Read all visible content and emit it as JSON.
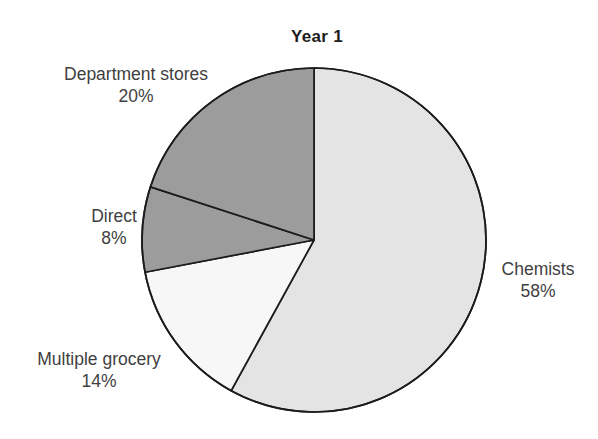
{
  "chart_data": {
    "type": "pie",
    "title": "Year 1",
    "subtitle": "",
    "xlabel": "",
    "ylabel": "",
    "legend_position": "none",
    "grid": false,
    "units": "percent",
    "categories": [
      "Chemists",
      "Multiple grocery",
      "Direct",
      "Department stores"
    ],
    "values": [
      58,
      14,
      8,
      20
    ],
    "labels": [
      "Chemists",
      "Multiple grocery",
      "Direct",
      "Department stores"
    ],
    "value_labels": [
      "58%",
      "14%",
      "8%",
      "20%"
    ],
    "start_angle_deg": 0,
    "direction": "clockwise",
    "slices": [
      {
        "name": "Chemists",
        "value": 58,
        "value_label": "58%",
        "color": "#e4e4e4",
        "start_deg": 0,
        "end_deg": 208.8,
        "label_position": "right"
      },
      {
        "name": "Multiple grocery",
        "value": 14,
        "value_label": "14%",
        "color": "#f7f7f7",
        "start_deg": 208.8,
        "end_deg": 259.2,
        "label_position": "bottom-left"
      },
      {
        "name": "Direct",
        "value": 8,
        "value_label": "8%",
        "color": "#9c9c9c",
        "start_deg": 259.2,
        "end_deg": 288.0,
        "label_position": "left"
      },
      {
        "name": "Department stores",
        "value": 20,
        "value_label": "20%",
        "color": "#9c9c9c",
        "start_deg": 288.0,
        "end_deg": 360.0,
        "label_position": "top-left"
      }
    ],
    "total": 100,
    "stroke_color": "#1c1c1c",
    "background": "#ffffff"
  },
  "labels": {
    "department_stores": {
      "name": "Department stores",
      "value": "20%"
    },
    "direct": {
      "name": "Direct",
      "value": "8%"
    },
    "multiple_grocery": {
      "name": "Multiple grocery",
      "value": "14%"
    },
    "chemists": {
      "name": "Chemists",
      "value": "58%"
    }
  },
  "geometry": {
    "center_x": 314,
    "center_y": 240,
    "radius": 172
  }
}
